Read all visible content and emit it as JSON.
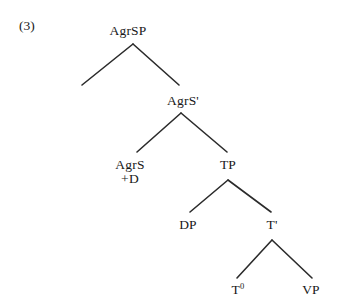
{
  "figure": {
    "example_number": "(3)",
    "type": "syntax-tree",
    "ink_color": "#2b2b2b",
    "background_color": "#ffffff",
    "text_color": "#181818"
  },
  "nodes": [
    {
      "id": "agrsp",
      "label": "AgrSP",
      "x": 128,
      "y": 24
    },
    {
      "id": "agrs-bar",
      "label": "AgrS'",
      "x": 183,
      "y": 94
    },
    {
      "id": "agrs-head",
      "label": "AgrS",
      "label2": "+D",
      "x": 130,
      "y": 158
    },
    {
      "id": "tp",
      "label": "TP",
      "x": 228,
      "y": 158
    },
    {
      "id": "dp",
      "label": "DP",
      "x": 188,
      "y": 218
    },
    {
      "id": "t-bar",
      "label": "T'",
      "x": 272,
      "y": 218
    },
    {
      "id": "t-zero",
      "label": "T",
      "sup": "0",
      "x": 238,
      "y": 283
    },
    {
      "id": "vp",
      "label": "VP",
      "x": 311,
      "y": 283
    }
  ],
  "branches": [
    {
      "id": "agrsp-to-spec",
      "x1": 133,
      "y1": 44,
      "x2": 82,
      "y2": 85
    },
    {
      "id": "agrsp-to-agrs-bar",
      "x1": 133,
      "y1": 44,
      "x2": 179,
      "y2": 85
    },
    {
      "id": "agrs-bar-to-agrs",
      "x1": 181,
      "y1": 113,
      "x2": 137,
      "y2": 152
    },
    {
      "id": "agrs-bar-to-tp",
      "x1": 181,
      "y1": 113,
      "x2": 227,
      "y2": 152
    },
    {
      "id": "tp-to-dp",
      "x1": 228,
      "y1": 180,
      "x2": 190,
      "y2": 212
    },
    {
      "id": "tp-to-t-bar",
      "x1": 228,
      "y1": 180,
      "x2": 271,
      "y2": 212
    },
    {
      "id": "t-bar-to-t-zero",
      "x1": 272,
      "y1": 240,
      "x2": 237,
      "y2": 278
    },
    {
      "id": "t-bar-to-vp",
      "x1": 272,
      "y1": 240,
      "x2": 312,
      "y2": 278
    }
  ]
}
